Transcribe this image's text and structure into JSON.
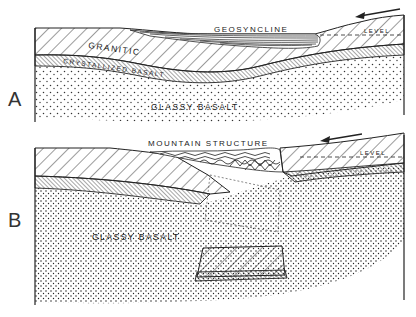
{
  "figure": {
    "panels": [
      {
        "id": "A",
        "label": "A",
        "title": "GEOSYNCLINE",
        "layers": [
          "GRANITIC",
          "CRYSTALLIZED BASALT",
          "GLASSY BASALT"
        ],
        "level_label": "LEVEL",
        "arrow": "left"
      },
      {
        "id": "B",
        "label": "B",
        "title": "MOUNTAIN STRUCTURE",
        "layers": [
          "GLASSY BASALT"
        ],
        "level_label": "LEVEL",
        "arrow": "left"
      }
    ]
  },
  "labels": {
    "a_panel": "A",
    "a_title": "GEOSYNCLINE",
    "a_granitic": "GRANITIC",
    "a_crystallized": "CRYSTALLIZED BASALT",
    "a_glassy": "GLASSY BASALT",
    "a_level": "LEVEL",
    "b_panel": "B",
    "b_title": "MOUNTAIN STRUCTURE",
    "b_glassy": "GLASSY BASALT",
    "b_level": "LEVEL"
  },
  "colors": {
    "ink": "#222222",
    "paper": "#ffffff"
  }
}
